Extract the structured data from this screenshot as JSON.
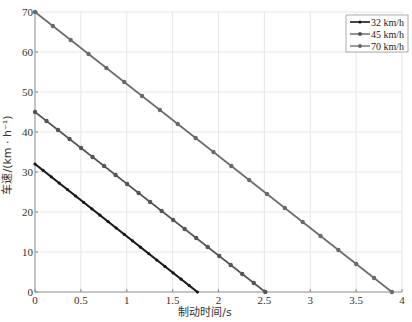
{
  "chart_data": {
    "type": "line",
    "title": "",
    "xlabel": "制动时间/s",
    "ylabel": "车速/(km · h⁻¹)",
    "xlim": [
      0,
      4
    ],
    "ylim": [
      0,
      70
    ],
    "xticks": [
      0,
      0.5,
      1,
      1.5,
      2,
      2.5,
      3,
      3.5,
      4
    ],
    "xtick_labels": [
      "0",
      "0.5",
      "1",
      "1.5",
      "2",
      "2.5",
      "3",
      "3.5",
      "4"
    ],
    "yticks": [
      0,
      10,
      20,
      30,
      40,
      50,
      60,
      70
    ],
    "ytick_labels": [
      "0",
      "10",
      "20",
      "30",
      "40",
      "50",
      "60",
      "70"
    ],
    "grid": true,
    "legend_position": "upper right",
    "series": [
      {
        "name": "32 km/h",
        "color": "#1a1a1a",
        "line_width": 2.2,
        "marker_r": 1.6,
        "start_speed": 32,
        "stop_time": 1.77,
        "points": 21,
        "x": [
          0,
          1.77
        ],
        "y": [
          32,
          0
        ]
      },
      {
        "name": "45 km/h",
        "color": "#555555",
        "line_width": 1.6,
        "marker_r": 2.2,
        "start_speed": 45,
        "stop_time": 2.51,
        "points": 21,
        "x": [
          0,
          2.51
        ],
        "y": [
          45,
          0
        ]
      },
      {
        "name": "70 km/h",
        "color": "#6a6a6a",
        "line_width": 1.6,
        "marker_r": 2.2,
        "start_speed": 70,
        "stop_time": 3.89,
        "points": 21,
        "x": [
          0,
          3.89
        ],
        "y": [
          70,
          0
        ]
      }
    ]
  },
  "legend": {
    "items": [
      "32 km/h",
      "45 km/h",
      "70 km/h"
    ]
  },
  "axes": {
    "x_title": "制动时间/s",
    "y_title": "车速/(km · h⁻¹)"
  }
}
